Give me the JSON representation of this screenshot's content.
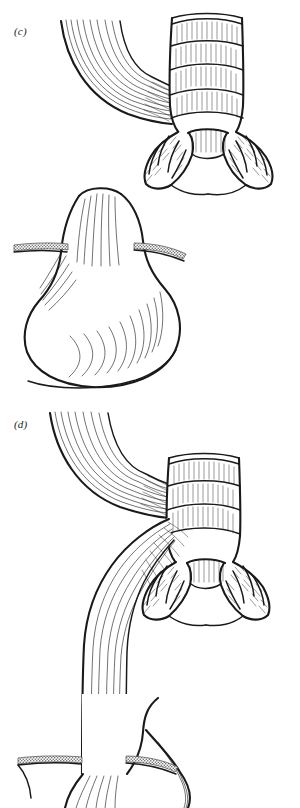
{
  "figure": {
    "type": "anatomical-line-drawing",
    "background_color": "#ffffff",
    "ink_color": "#1a1a1a",
    "width": 300,
    "height": 808
  },
  "panels": [
    {
      "label": "(c)",
      "label_style": "italic",
      "description": "Esophageal atresia without fistula: blind-ending upper esophageal pouch above, separate short blind lower esophagus entering the stomach below, trachea bifurcating into main bronchi.",
      "structures": [
        "upper-esophageal-pouch",
        "trachea",
        "carina",
        "left-main-bronchus",
        "right-main-bronchus",
        "lower-esophageal-segment",
        "stomach",
        "diaphragm-crura"
      ]
    },
    {
      "label": "(d)",
      "label_style": "italic",
      "description": "Esophageal atresia with distal tracheoesophageal fistula: upper esophagus ends blindly at the trachea, lower esophagus arises from the trachea and descends to the stomach.",
      "structures": [
        "upper-esophageal-pouch",
        "trachea",
        "tracheoesophageal-fistula",
        "carina",
        "left-main-bronchus",
        "right-main-bronchus",
        "distal-esophagus",
        "stomach",
        "diaphragm-crura"
      ]
    }
  ],
  "colors": {
    "ink": "#1a1a1a",
    "paper": "#ffffff",
    "hatch": "#3a3a3a",
    "crura_stipple": "#8d8d8d"
  }
}
